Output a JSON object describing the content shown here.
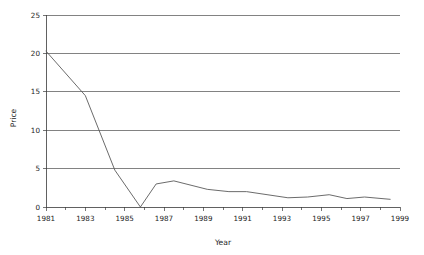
{
  "chart_data": {
    "type": "line",
    "title": "",
    "subtitle": "",
    "xlabel": "Year",
    "ylabel": "Price",
    "xlim": [
      1981,
      1999
    ],
    "ylim": [
      0,
      25
    ],
    "grid": true,
    "legend": false,
    "legend_position": "none",
    "x_tick_labels": [
      "1981",
      "1983",
      "1985",
      "1987",
      "1989",
      "1991",
      "1993",
      "1995",
      "1997",
      "1999"
    ],
    "x_tick_values": [
      1981,
      1983,
      1985,
      1987,
      1989,
      1991,
      1993,
      1995,
      1997,
      1999
    ],
    "x_minor_tick_values": [
      1982,
      1984,
      1986,
      1988,
      1990,
      1992,
      1994,
      1996,
      1998
    ],
    "y_tick_labels": [
      "0",
      "5",
      "10",
      "15",
      "20",
      "25"
    ],
    "y_tick_values": [
      0,
      5,
      10,
      15,
      20,
      25
    ],
    "gridline_values": [
      5,
      10,
      15,
      20,
      25
    ],
    "line_color": "#5a5a5a",
    "axis_color": "#3a3a3a",
    "grid_color": "#4d4d4d",
    "background_color": "#ffffff",
    "series": [
      {
        "name": "Price",
        "x": [
          1981.0,
          1983.0,
          1984.5,
          1985.8,
          1986.6,
          1987.5,
          1989.2,
          1990.3,
          1991.2,
          1993.3,
          1994.3,
          1995.4,
          1996.3,
          1997.2,
          1998.5
        ],
        "values": [
          20.3,
          14.5,
          4.8,
          0.0,
          3.0,
          3.4,
          2.3,
          2.0,
          2.0,
          1.2,
          1.3,
          1.6,
          1.1,
          1.3,
          1.0
        ]
      }
    ]
  }
}
